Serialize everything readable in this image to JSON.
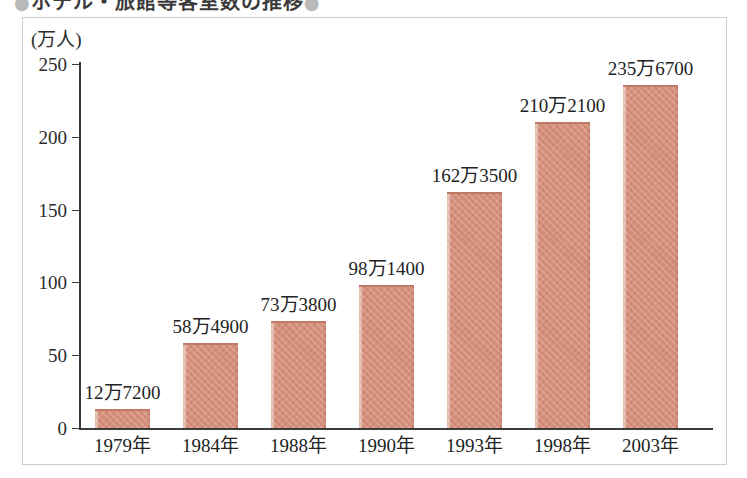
{
  "title": {
    "text": "ホテル・旅館等客室数の推移",
    "bullet_left": "●",
    "bullet_right": "●"
  },
  "chart_data": {
    "type": "bar",
    "title": "ホテル・旅館等客室数の推移",
    "xlabel": "",
    "ylabel": "",
    "yunit": "(万人)",
    "ylim": [
      0,
      250
    ],
    "yticks": [
      0,
      50,
      100,
      150,
      200,
      250
    ],
    "ytick_labels": [
      "0",
      "50",
      "100",
      "150",
      "200",
      "250"
    ],
    "grid": false,
    "legend": "none",
    "categories": [
      "1979年",
      "1984年",
      "1988年",
      "1990年",
      "1993年",
      "1998年",
      "2003年"
    ],
    "values": [
      12.72,
      58.49,
      73.38,
      98.14,
      162.35,
      210.21,
      235.67
    ],
    "data_labels": [
      "12万7200",
      "58万4900",
      "73万3800",
      "98万1400",
      "162万3500",
      "210万2100",
      "235万6700"
    ],
    "bar_color": "#d4907b",
    "bar_edge_color": "#c07a63",
    "axis_color": "#3b3b3b",
    "frame_color": "#cfcbc5",
    "background": "#ffffff"
  }
}
